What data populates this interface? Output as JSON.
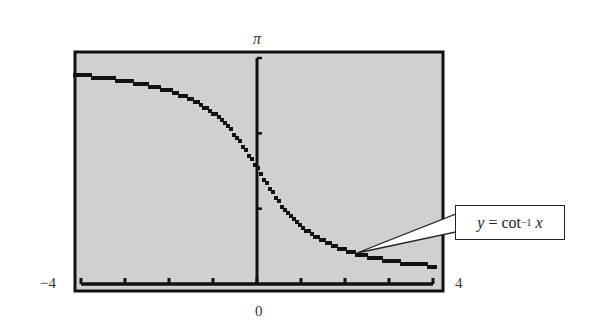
{
  "chart_data": {
    "type": "line",
    "title": "",
    "function": "y = arccot(x)",
    "xlabel": "",
    "ylabel": "",
    "xlim": [
      -4,
      4
    ],
    "ylim": [
      0,
      3.14159
    ],
    "x_tick_labels": {
      "left": "-4",
      "center": "0",
      "right": "4"
    },
    "y_tick_labels": {
      "top": "π"
    },
    "x_ticks": [
      -4,
      -3,
      -2,
      -1,
      0,
      1,
      2,
      3,
      4
    ],
    "y_ticks": [
      1.0472,
      2.0944,
      3.14159
    ],
    "grid": false,
    "background": "#d0d0d0",
    "series": [
      {
        "name": "y = cot^-1 x",
        "x": [
          -4,
          -3.5,
          -3,
          -2.5,
          -2,
          -1.5,
          -1,
          -0.5,
          0,
          0.5,
          1,
          1.5,
          2,
          2.5,
          3,
          3.5,
          4
        ],
        "y": [
          2.897,
          2.863,
          2.82,
          2.761,
          2.678,
          2.554,
          2.356,
          2.034,
          1.571,
          1.107,
          0.785,
          0.588,
          0.464,
          0.381,
          0.322,
          0.278,
          0.245
        ]
      }
    ],
    "annotations": [
      {
        "text": "y = cot⁻¹ x",
        "points_to_x": 2.2
      }
    ]
  },
  "labels": {
    "y_top": "π",
    "x_left": "−4",
    "x_zero": "0",
    "x_right": "4",
    "callout_y": "y",
    "callout_eq": " = cot",
    "callout_sup": "−1",
    "callout_x": "x"
  },
  "colors": {
    "plot_bg": "#d0d0d0",
    "frame": "#111111",
    "curve": "#111111"
  }
}
